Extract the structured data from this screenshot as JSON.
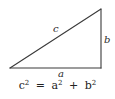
{
  "diagram": {
    "labels": {
      "hypotenuse": "c",
      "vertical_leg": "b",
      "horizontal_leg": "a"
    },
    "formula": {
      "lhs_var": "c",
      "lhs_exp": "2",
      "equals": "=",
      "term1_var": "a",
      "term1_exp": "2",
      "plus": "+",
      "term2_var": "b",
      "term2_exp": "2"
    }
  }
}
